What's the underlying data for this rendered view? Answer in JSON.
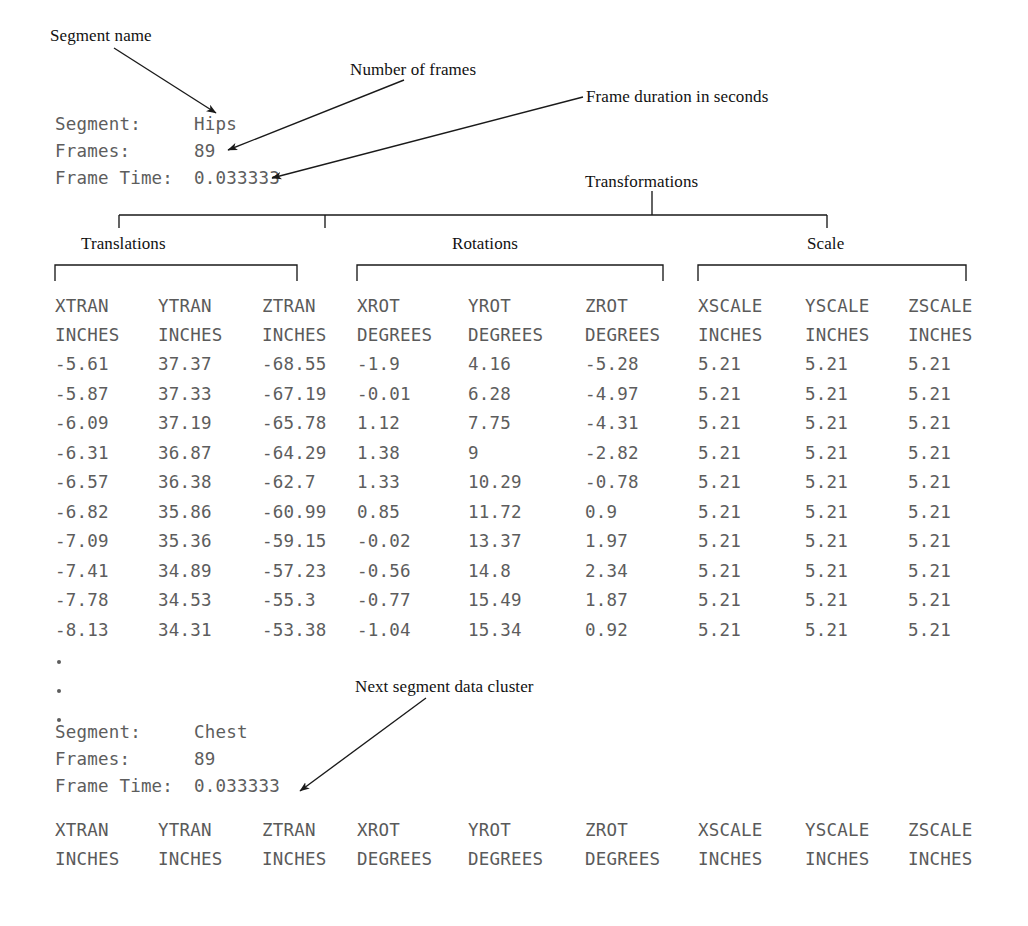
{
  "annotations": {
    "segment_name": "Segment name",
    "number_of_frames": "Number of frames",
    "frame_duration": "Frame duration in seconds",
    "transformations": "Transformations",
    "translations": "Translations",
    "rotations": "Rotations",
    "scale": "Scale",
    "next_segment": "Next segment data cluster"
  },
  "segment_one": {
    "segment_label": "Segment:",
    "segment_value": "Hips",
    "frames_label": "Frames:",
    "frames_value": "89",
    "frame_time_label": "Frame Time:",
    "frame_time_value": "0.033333"
  },
  "segment_two": {
    "segment_label": "Segment:",
    "segment_value": "Chest",
    "frames_label": "Frames:",
    "frames_value": "89",
    "frame_time_label": "Frame Time:",
    "frame_time_value": "0.033333"
  },
  "table": {
    "headers": [
      "XTRAN",
      "YTRAN",
      "ZTRAN",
      "XROT",
      "YROT",
      "ZROT",
      "XSCALE",
      "YSCALE",
      "ZSCALE"
    ],
    "units": [
      "INCHES",
      "INCHES",
      "INCHES",
      "DEGREES",
      "DEGREES",
      "DEGREES",
      "INCHES",
      "INCHES",
      "INCHES"
    ],
    "rows": [
      [
        "-5.61",
        "37.37",
        "-68.55",
        "-1.9",
        "4.16",
        "-5.28",
        "5.21",
        "5.21",
        "5.21"
      ],
      [
        "-5.87",
        "37.33",
        "-67.19",
        "-0.01",
        "6.28",
        "-4.97",
        "5.21",
        "5.21",
        "5.21"
      ],
      [
        "-6.09",
        "37.19",
        "-65.78",
        "1.12",
        "7.75",
        "-4.31",
        "5.21",
        "5.21",
        "5.21"
      ],
      [
        "-6.31",
        "36.87",
        "-64.29",
        "1.38",
        "9",
        "-2.82",
        "5.21",
        "5.21",
        "5.21"
      ],
      [
        "-6.57",
        "36.38",
        "-62.7",
        "1.33",
        "10.29",
        "-0.78",
        "5.21",
        "5.21",
        "5.21"
      ],
      [
        "-6.82",
        "35.86",
        "-60.99",
        "0.85",
        "11.72",
        "0.9",
        "5.21",
        "5.21",
        "5.21"
      ],
      [
        "-7.09",
        "35.36",
        "-59.15",
        "-0.02",
        "13.37",
        "1.97",
        "5.21",
        "5.21",
        "5.21"
      ],
      [
        "-7.41",
        "34.89",
        "-57.23",
        "-0.56",
        "14.8",
        "2.34",
        "5.21",
        "5.21",
        "5.21"
      ],
      [
        "-7.78",
        "34.53",
        "-55.3",
        "-0.77",
        "15.49",
        "1.87",
        "5.21",
        "5.21",
        "5.21"
      ],
      [
        "-8.13",
        "34.31",
        "-53.38",
        "-1.04",
        "15.34",
        "0.92",
        "5.21",
        "5.21",
        "5.21"
      ]
    ]
  },
  "continuation": {
    "marks": [
      ".",
      ".",
      "."
    ]
  },
  "colors": {
    "text": "#000000",
    "data_text": "#5d5d5d",
    "rule": "#1a1a1a",
    "background": "#ffffff"
  }
}
